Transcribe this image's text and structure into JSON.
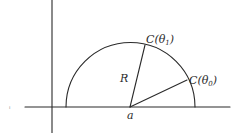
{
  "diagram": {
    "center_label": "a",
    "radius_label": "R",
    "points": [
      {
        "id": "c_theta1",
        "label_main": "C(θ",
        "label_sub": "1",
        "label_close": ")"
      },
      {
        "id": "c_theta0",
        "label_main": "C(θ",
        "label_sub": "0",
        "label_close": ")"
      }
    ],
    "stray_mark": "ı"
  }
}
